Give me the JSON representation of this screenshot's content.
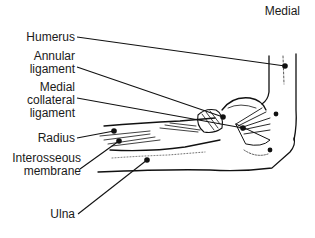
{
  "figure": {
    "view_label": "Medial",
    "labels": [
      {
        "id": "humerus",
        "lines": [
          "Humerus"
        ]
      },
      {
        "id": "annular-ligament",
        "lines": [
          "Annular",
          "ligament"
        ]
      },
      {
        "id": "medial-collateral-ligament",
        "lines": [
          "Medial",
          "collateral",
          "ligament"
        ]
      },
      {
        "id": "radius",
        "lines": [
          "Radius"
        ]
      },
      {
        "id": "interosseous-membrane",
        "lines": [
          "Interosseous",
          "membrane"
        ]
      },
      {
        "id": "ulna",
        "lines": [
          "Ulna"
        ]
      }
    ]
  }
}
